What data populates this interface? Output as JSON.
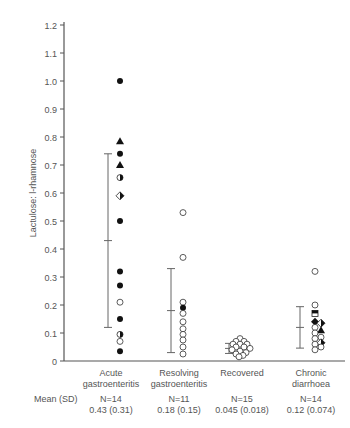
{
  "chart_data": {
    "type": "scatter",
    "title": "",
    "xlabel": "",
    "ylabel": "Lactulose: l-rhamnose",
    "ylim": [
      0,
      1.2
    ],
    "yticks": [
      "0",
      "0.1",
      "0.2",
      "0.3",
      "0.4",
      "0.5",
      "0.6",
      "0.7",
      "0.8",
      "0.9",
      "1.0",
      "1.1",
      "1.2"
    ],
    "grid": false,
    "legend": null,
    "categories": [
      {
        "line1": "Acute",
        "line2": "gastroenteritis"
      },
      {
        "line1": "Resolving",
        "line2": "gastroenteritis"
      },
      {
        "line1": "Recovered",
        "line2": ""
      },
      {
        "line1": "Chronic",
        "line2": "diarrhoea"
      }
    ],
    "stats_label": "Mean (SD)",
    "stats": [
      {
        "n": "N=14",
        "mean_sd": "0.43 (0.31)",
        "mean": 0.43,
        "low": 0.12,
        "high": 0.74
      },
      {
        "n": "N=11",
        "mean_sd": "0.18 (0.15)",
        "mean": 0.18,
        "low": 0.03,
        "high": 0.33
      },
      {
        "n": "N=15",
        "mean_sd": "0.045 (0.018)",
        "mean": 0.045,
        "low": 0.027,
        "high": 0.063
      },
      {
        "n": "N=14",
        "mean_sd": "0.12 (0.074)",
        "mean": 0.12,
        "low": 0.046,
        "high": 0.194
      }
    ],
    "series": [
      {
        "name": "Acute gastroenteritis",
        "points": [
          {
            "v": 1.0,
            "m": "filled-circle",
            "dx": 0
          },
          {
            "v": 0.785,
            "m": "filled-triangle",
            "dx": 0
          },
          {
            "v": 0.74,
            "m": "filled-circle",
            "dx": 0
          },
          {
            "v": 0.7,
            "m": "filled-triangle",
            "dx": 0
          },
          {
            "v": 0.655,
            "m": "half-circle",
            "dx": 0
          },
          {
            "v": 0.59,
            "m": "half-diamond",
            "dx": 0
          },
          {
            "v": 0.5,
            "m": "filled-circle",
            "dx": 0
          },
          {
            "v": 0.32,
            "m": "filled-circle",
            "dx": 0
          },
          {
            "v": 0.27,
            "m": "filled-circle",
            "dx": 0
          },
          {
            "v": 0.21,
            "m": "open-circle",
            "dx": 0
          },
          {
            "v": 0.15,
            "m": "filled-circle",
            "dx": 0
          },
          {
            "v": 0.095,
            "m": "half-circle",
            "dx": 0
          },
          {
            "v": 0.07,
            "m": "open-circle",
            "dx": 0
          },
          {
            "v": 0.035,
            "m": "filled-circle",
            "dx": 0
          }
        ]
      },
      {
        "name": "Resolving gastroenteritis",
        "points": [
          {
            "v": 0.53,
            "m": "open-circle",
            "dx": 0
          },
          {
            "v": 0.37,
            "m": "open-circle",
            "dx": 0
          },
          {
            "v": 0.21,
            "m": "open-circle",
            "dx": 0
          },
          {
            "v": 0.19,
            "m": "filled-circle",
            "dx": 0
          },
          {
            "v": 0.17,
            "m": "open-circle",
            "dx": 0
          },
          {
            "v": 0.14,
            "m": "open-circle",
            "dx": 0
          },
          {
            "v": 0.115,
            "m": "open-circle",
            "dx": 0
          },
          {
            "v": 0.095,
            "m": "open-circle",
            "dx": 0
          },
          {
            "v": 0.075,
            "m": "open-circle",
            "dx": 0
          },
          {
            "v": 0.05,
            "m": "open-circle",
            "dx": 0
          },
          {
            "v": 0.025,
            "m": "open-circle",
            "dx": 0
          }
        ]
      },
      {
        "name": "Recovered",
        "points": [
          {
            "v": 0.08,
            "m": "open-circle",
            "dx": 0
          },
          {
            "v": 0.07,
            "m": "open-circle",
            "dx": -4
          },
          {
            "v": 0.07,
            "m": "open-circle",
            "dx": 4
          },
          {
            "v": 0.06,
            "m": "open-circle",
            "dx": -7
          },
          {
            "v": 0.06,
            "m": "open-circle",
            "dx": 0
          },
          {
            "v": 0.06,
            "m": "open-circle",
            "dx": 7
          },
          {
            "v": 0.05,
            "m": "open-circle",
            "dx": -4
          },
          {
            "v": 0.05,
            "m": "open-circle",
            "dx": 4
          },
          {
            "v": 0.045,
            "m": "open-circle",
            "dx": 10
          },
          {
            "v": 0.04,
            "m": "open-circle",
            "dx": -8
          },
          {
            "v": 0.035,
            "m": "open-circle",
            "dx": 0
          },
          {
            "v": 0.03,
            "m": "open-circle",
            "dx": 6
          },
          {
            "v": 0.025,
            "m": "open-circle",
            "dx": -4
          },
          {
            "v": 0.02,
            "m": "open-circle",
            "dx": 3
          },
          {
            "v": 0.015,
            "m": "open-circle",
            "dx": -1
          }
        ]
      },
      {
        "name": "Chronic diarrhoea",
        "points": [
          {
            "v": 0.32,
            "m": "open-circle",
            "dx": 0
          },
          {
            "v": 0.2,
            "m": "open-circle",
            "dx": 0
          },
          {
            "v": 0.17,
            "m": "half-square",
            "dx": 0
          },
          {
            "v": 0.14,
            "m": "filled-diamond",
            "dx": 0
          },
          {
            "v": 0.135,
            "m": "half-diamond",
            "dx": 6
          },
          {
            "v": 0.12,
            "m": "open-circle",
            "dx": 0
          },
          {
            "v": 0.11,
            "m": "filled-triangle",
            "dx": 6
          },
          {
            "v": 0.1,
            "m": "open-circle",
            "dx": 0
          },
          {
            "v": 0.085,
            "m": "open-circle",
            "dx": 6
          },
          {
            "v": 0.08,
            "m": "open-circle",
            "dx": 0
          },
          {
            "v": 0.065,
            "m": "half-diamond",
            "dx": 6
          },
          {
            "v": 0.06,
            "m": "open-circle",
            "dx": 0
          },
          {
            "v": 0.05,
            "m": "open-circle",
            "dx": 6
          },
          {
            "v": 0.04,
            "m": "open-circle",
            "dx": 0
          }
        ]
      }
    ]
  }
}
